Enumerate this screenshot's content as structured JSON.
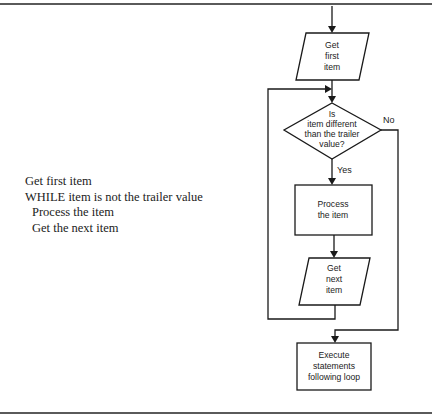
{
  "pseudocode": {
    "lines": [
      "Get first item",
      "WHILE item is not the trailer value",
      "Process the item",
      "Get the next item"
    ]
  },
  "flowchart": {
    "nodes": {
      "get_first": {
        "shape": "parallelogram",
        "lines": [
          "Get",
          "first",
          "item"
        ]
      },
      "decision": {
        "shape": "diamond",
        "lines": [
          "Is",
          "item different",
          "than the trailer",
          "value?"
        ]
      },
      "process": {
        "shape": "rectangle",
        "lines": [
          "Process",
          "the item"
        ]
      },
      "get_next": {
        "shape": "parallelogram",
        "lines": [
          "Get",
          "next",
          "item"
        ]
      },
      "execute": {
        "shape": "rectangle",
        "lines": [
          "Execute",
          "statements",
          "following loop"
        ]
      }
    },
    "edges": {
      "yes_label": "Yes",
      "no_label": "No"
    }
  },
  "colors": {
    "stroke": "#1a1a1a",
    "rule": "#5a5a5a",
    "text": "#222222",
    "background": "#ffffff"
  }
}
